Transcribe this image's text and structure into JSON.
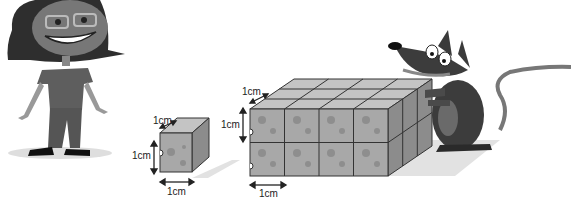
{
  "scene": {
    "description": "Illustration comparing a 1cm cheese cube with a block of cheese cubes",
    "characters": [
      {
        "name": "girl",
        "position": "left"
      },
      {
        "name": "mouse",
        "position": "right"
      }
    ]
  },
  "small_cube": {
    "depth_label": "1cm",
    "height_label": "1cm",
    "width_label": "1cm"
  },
  "large_block": {
    "depth_label": "1cm",
    "height_label": "1cm",
    "width_label": "1cm",
    "front_columns": 4,
    "rows": 2,
    "depth": 3
  },
  "colors": {
    "cube_front": "#a8a8a8",
    "cube_top": "#c4c4c4",
    "cube_side": "#8c8c8c",
    "hole": "#8a8a8a",
    "outline": "#333333",
    "shadow": "#e0e0e0",
    "dark": "#3a3a3a",
    "mid": "#6e6e6e"
  }
}
